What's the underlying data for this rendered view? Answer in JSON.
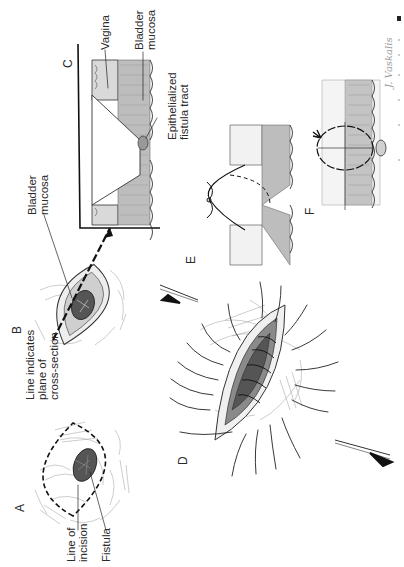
{
  "figure": {
    "orientation": "rotated 90deg counter-clockwise",
    "signature": "J. Vaskalis",
    "panels": {
      "A": {
        "letter": "A",
        "labels": {
          "line_of_incision": [
            "Line of",
            "incision"
          ],
          "fistula": "Fistula"
        }
      },
      "B": {
        "letter": "B",
        "labels": {
          "plane": [
            "Line indicates",
            "plane of",
            "cross-section"
          ],
          "bladder_mucosa": [
            "Bladder",
            "mucosa"
          ]
        }
      },
      "C": {
        "letter": "C",
        "labels": {
          "vagina": "Vagina",
          "bladder_mucosa": [
            "Bladder",
            "mucosa"
          ],
          "fistula_tract": [
            "Epithelialized",
            "fistula tract"
          ]
        }
      },
      "D": {
        "letter": "D"
      },
      "E": {
        "letter": "E"
      },
      "F": {
        "letter": "F"
      }
    }
  },
  "colors": {
    "ink": "#222222",
    "tissue": "#d9d9d9",
    "dark_tissue": "#555555",
    "background": "#ffffff"
  }
}
